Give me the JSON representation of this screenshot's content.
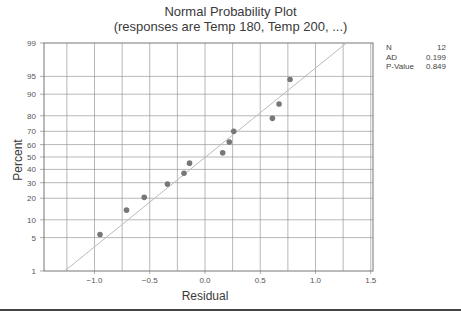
{
  "title_line1": "Normal Probability Plot",
  "title_line2": "(responses are Temp 180, Temp 200, ...)",
  "xlabel": "Residual",
  "ylabel": "Percent",
  "stats": [
    {
      "label": "N",
      "value": "12"
    },
    {
      "label": "AD",
      "value": "0.199"
    },
    {
      "label": "P-Value",
      "value": "0.849"
    }
  ],
  "x_ticks": [
    "-1.0",
    "-0.5",
    "0.0",
    "0.5",
    "1.0",
    "1.5"
  ],
  "y_ticks": [
    "1",
    "5",
    "10",
    "20",
    "30",
    "40",
    "50",
    "60",
    "70",
    "80",
    "90",
    "95",
    "99"
  ],
  "colors": {
    "points": "#777777",
    "fit_line": "#bbbbbb",
    "grid": "#888888"
  },
  "chart_data": {
    "type": "scatter",
    "xlabel": "Residual",
    "ylabel": "Percent",
    "xlim": [
      -1.4,
      1.55
    ],
    "ylim": [
      1,
      99
    ],
    "y_scale": "normal-probability",
    "grid": true,
    "legend": "stats box at right: N=12, AD=0.199, P-Value=0.849",
    "x_ticks": [
      -1.0,
      -0.5,
      0.0,
      0.5,
      1.0,
      1.5
    ],
    "y_ticks": [
      1,
      5,
      10,
      20,
      30,
      40,
      50,
      60,
      70,
      80,
      90,
      95,
      99
    ],
    "series": [
      {
        "name": "Residuals",
        "x": [
          -0.95,
          -0.71,
          -0.55,
          -0.34,
          -0.19,
          -0.14,
          0.16,
          0.22,
          0.26,
          0.61,
          0.67,
          0.77
        ],
        "y": [
          5.7,
          13.9,
          20.5,
          29.0,
          37.0,
          45.0,
          53.5,
          62.0,
          70.0,
          78.5,
          86.0,
          94.3
        ]
      },
      {
        "name": "Normal fit line",
        "x": [
          -1.27,
          1.28
        ],
        "y": [
          1,
          99
        ]
      }
    ],
    "annotations": [
      {
        "N": 12,
        "AD": 0.199,
        "P-Value": 0.849
      }
    ]
  }
}
